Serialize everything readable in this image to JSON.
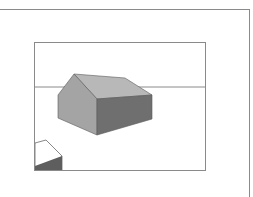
{
  "figure": {
    "colors": {
      "frame": "#8a8a8a",
      "horizon": "#8a8a8a",
      "gable_face": "#a4a4a4",
      "roof": "#b8b8b8",
      "side_wall": "#6f6f6f",
      "edge": "#5a5a5a",
      "corner_shape_top": "#ffffff",
      "corner_shape_side": "#5e5e5e"
    }
  }
}
